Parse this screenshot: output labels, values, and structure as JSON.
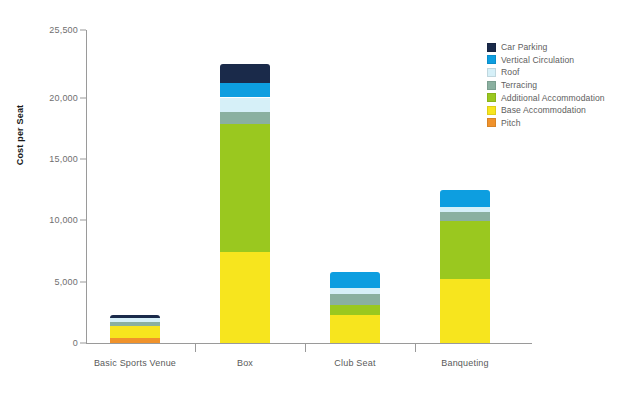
{
  "chart_data": {
    "type": "bar",
    "stacked": true,
    "title": "",
    "xlabel": "",
    "ylabel": "Cost per Seat",
    "categories": [
      "Basic Sports Venue",
      "Box",
      "Club Seat",
      "Banqueting"
    ],
    "ylim": [
      0,
      25500
    ],
    "yticks": [
      0,
      5000,
      10000,
      15000,
      20000,
      25500
    ],
    "ytick_labels": [
      "0",
      "5,000",
      "10,000",
      "15,000",
      "20,000",
      "25,500"
    ],
    "grid": false,
    "legend_position": "top-right",
    "series": [
      {
        "name": "Pitch",
        "color": "#f0922b",
        "values": [
          400,
          0,
          0,
          0
        ]
      },
      {
        "name": "Base Accommodation",
        "color": "#f7e51e",
        "values": [
          1000,
          7450,
          2300,
          5250
        ]
      },
      {
        "name": "Additional Accommodation",
        "color": "#9ac81f",
        "values": [
          0,
          10400,
          800,
          4650
        ]
      },
      {
        "name": "Terracing",
        "color": "#8ab0a0",
        "values": [
          350,
          1000,
          900,
          800
        ]
      },
      {
        "name": "Roof",
        "color": "#d6f0f8",
        "values": [
          250,
          1150,
          500,
          350
        ]
      },
      {
        "name": "Vertical Circulation",
        "color": "#0d9ee0",
        "values": [
          0,
          1200,
          1300,
          1450
        ]
      },
      {
        "name": "Car Parking",
        "color": "#1a2a4a",
        "values": [
          250,
          1550,
          0,
          0
        ]
      }
    ],
    "totals": [
      2250,
      22750,
      5800,
      12500
    ]
  },
  "legend": {
    "items": [
      {
        "label": "Car Parking",
        "color": "#1a2a4a"
      },
      {
        "label": "Vertical Circulation",
        "color": "#0d9ee0"
      },
      {
        "label": "Roof",
        "color": "#d6f0f8"
      },
      {
        "label": "Terracing",
        "color": "#8ab0a0"
      },
      {
        "label": "Additional Accommodation",
        "color": "#9ac81f"
      },
      {
        "label": "Base Accommodation",
        "color": "#f7e51e"
      },
      {
        "label": "Pitch",
        "color": "#f0922b"
      }
    ]
  },
  "axes": {
    "y_title": "Cost per Seat"
  }
}
